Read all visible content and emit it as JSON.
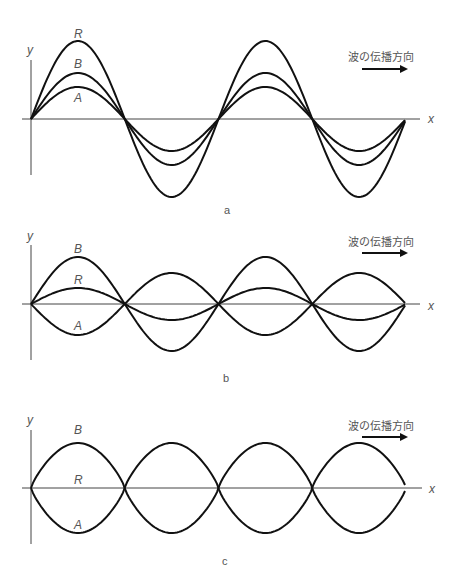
{
  "direction_label": "波の伝播方向",
  "axis_labels": {
    "x": "x",
    "y": "y"
  },
  "panels": [
    {
      "id": "a",
      "caption": "a",
      "axis_y": 119,
      "wave_labels": {
        "R": "R",
        "B": "B",
        "A": "A"
      },
      "amplitudes": {
        "A": 32,
        "B": 46,
        "R": 78
      },
      "description": "A and B in phase; R = A + B (constructive interference)"
    },
    {
      "id": "b",
      "caption": "b",
      "axis_y": 304,
      "wave_labels": {
        "R": "R",
        "B": "B",
        "A": "A"
      },
      "amplitudes": {
        "A": -31,
        "B": 47,
        "R": 16
      },
      "description": "A and B opposite phase, unequal amplitude; R small"
    },
    {
      "id": "c",
      "caption": "c",
      "axis_y": 488,
      "wave_labels": {
        "R": "R",
        "B": "B",
        "A": "A"
      },
      "amplitudes": {
        "A": -45,
        "B": 45,
        "R": 0
      },
      "description": "A and B opposite phase, equal amplitude; R = 0 (destructive interference)"
    }
  ],
  "geometry": {
    "x_start": 31,
    "x_end": 406,
    "wavelength": 187.5
  }
}
